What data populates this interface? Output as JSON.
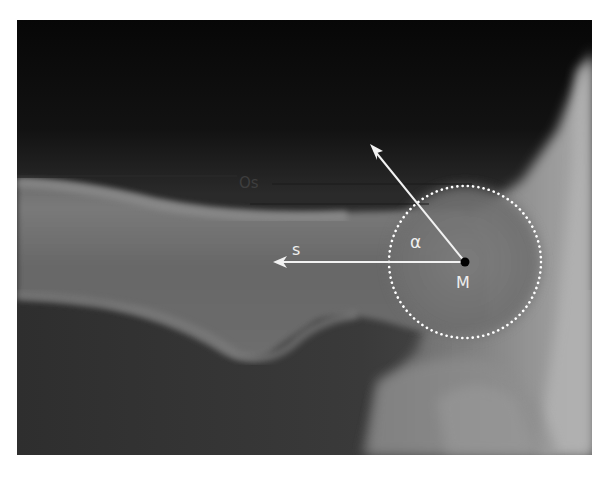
{
  "figure": {
    "labels": {
      "os": "Os",
      "s": "s",
      "alpha": "α",
      "m": "M"
    },
    "annotation_color": "#ffffff",
    "center_point_color": "#000000",
    "circle_style": "dotted"
  }
}
